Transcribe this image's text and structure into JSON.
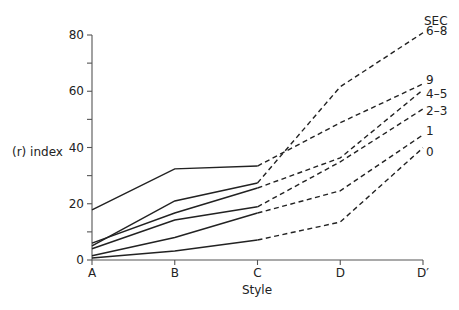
{
  "chart_data": {
    "type": "line",
    "title": "",
    "xlabel": "Style",
    "ylabel": "(r) index",
    "categories": [
      "A",
      "B",
      "C",
      "D",
      "D′"
    ],
    "ylim": [
      0,
      80
    ],
    "yticks": [
      0,
      20,
      40,
      60,
      80
    ],
    "yminor_ticks": [
      10,
      30,
      50,
      70
    ],
    "grid": false,
    "legend_title": "SEC",
    "legend_position": "right, inline at line ends",
    "line_style_note": "Solid segments A–C, dashed segments C–D′",
    "series": [
      {
        "name": "6–8",
        "values": [
          5,
          21,
          27.4,
          61.6,
          80.8
        ]
      },
      {
        "name": "9",
        "values": [
          17.8,
          32.4,
          33.4,
          48.8,
          62.6
        ]
      },
      {
        "name": "4–5",
        "values": [
          6,
          16.7,
          25.6,
          36.3,
          60.5
        ]
      },
      {
        "name": "2–3",
        "values": [
          4,
          14.2,
          18.9,
          34.9,
          53.7
        ]
      },
      {
        "name": "1",
        "values": [
          1.5,
          8,
          16.7,
          24.6,
          44.5
        ]
      },
      {
        "name": "0",
        "values": [
          0.7,
          3.2,
          7.1,
          13.5,
          39.9
        ]
      }
    ]
  },
  "layout": {
    "plot_left": 92,
    "plot_right": 423,
    "y_zero_px": 260,
    "y_top_px": 35,
    "line_color": "#222222",
    "axis_color": "#555555"
  }
}
